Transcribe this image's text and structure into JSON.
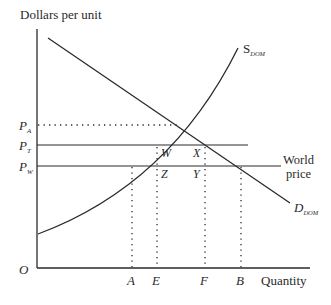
{
  "diagram": {
    "y_axis_label": "Dollars per unit",
    "x_axis_label": "Quantity",
    "origin_label": "O",
    "price_labels": {
      "pa": {
        "main": "P",
        "sub": "A"
      },
      "pt": {
        "main": "P",
        "sub": "T"
      },
      "pw": {
        "main": "P",
        "sub": "W"
      }
    },
    "quantity_labels": {
      "a": "A",
      "e": "E",
      "f": "F",
      "b": "B"
    },
    "point_labels": {
      "w": "W",
      "x": "X",
      "z": "Z",
      "y": "Y"
    },
    "supply_label": {
      "main": "S",
      "sub": "DOM"
    },
    "demand_label": {
      "main": "D",
      "sub": "DOM"
    },
    "world_price_label": {
      "line1": "World",
      "line2": "price"
    },
    "colors": {
      "line": "#2a2a2a",
      "background": "#ffffff"
    }
  }
}
